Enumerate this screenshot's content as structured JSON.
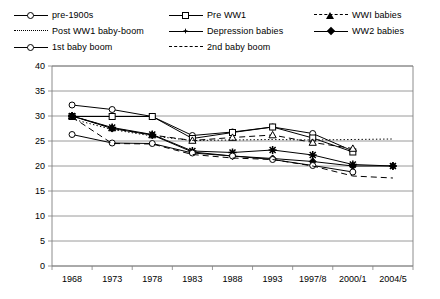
{
  "chart_data": {
    "type": "line",
    "title": "",
    "subtitle": "",
    "xlabel": "",
    "ylabel": "",
    "categories": [
      "1968",
      "1973",
      "1978",
      "1983",
      "1988",
      "1993",
      "1997/8",
      "2000/1",
      "2004/5"
    ],
    "ylim": [
      0,
      40
    ],
    "yticks": [
      0,
      5,
      10,
      15,
      20,
      25,
      30,
      35,
      40
    ],
    "grid": true,
    "legend_position": "top",
    "series": [
      {
        "name": "pre-1900s",
        "marker": "open-circle",
        "line_style": "solid",
        "values": [
          32.2,
          31.3,
          29.9,
          26.1,
          26.8,
          27.8,
          26.5,
          23.0,
          null
        ]
      },
      {
        "name": "Pre WW1",
        "marker": "open-square",
        "line_style": "solid",
        "values": [
          29.9,
          29.9,
          29.9,
          25.5,
          26.7,
          27.8,
          25.6,
          22.8,
          null
        ]
      },
      {
        "name": "WWI babies",
        "marker": "open-triangle",
        "line_style": "dashed",
        "values": [
          30.0,
          27.6,
          26.2,
          25.1,
          25.7,
          26.2,
          24.7,
          23.5,
          null
        ]
      },
      {
        "name": "Post WW1 baby-boom",
        "marker": "none",
        "line_style": "dotted",
        "values": [
          29.4,
          27.3,
          26.0,
          25.1,
          25.2,
          25.3,
          25.2,
          25.3,
          25.4
        ]
      },
      {
        "name": "Depression babies",
        "marker": "star-cross",
        "line_style": "solid",
        "values": [
          30.0,
          27.7,
          26.3,
          23.0,
          22.7,
          23.2,
          22.2,
          20.3,
          20.0
        ]
      },
      {
        "name": "WW2 babies",
        "marker": "filled-diamond",
        "line_style": "solid",
        "values": [
          30.0,
          27.5,
          26.2,
          22.8,
          22.0,
          21.5,
          20.9,
          20.0,
          20.0
        ]
      },
      {
        "name": "1st baby boom",
        "marker": "open-circle",
        "line_style": "solid",
        "values": [
          26.3,
          24.6,
          24.5,
          22.6,
          22.0,
          21.3,
          20.1,
          18.8,
          null
        ]
      },
      {
        "name": "2nd baby boom",
        "marker": "none",
        "line_style": "dashed",
        "values": [
          29.8,
          24.5,
          24.4,
          22.3,
          21.6,
          21.3,
          20.0,
          18.0,
          17.6
        ]
      }
    ]
  },
  "legend": {
    "items": [
      {
        "label": "pre-1900s",
        "key": "solid-open-circle"
      },
      {
        "label": "Pre WW1",
        "key": "solid-open-square"
      },
      {
        "label": "WWI babies",
        "key": "dashed-open-triangle"
      },
      {
        "label": "Post WW1 baby-boom",
        "key": "dotted-none"
      },
      {
        "label": "Depression babies",
        "key": "solid-star-cross"
      },
      {
        "label": "WW2 babies",
        "key": "solid-filled-diamond"
      },
      {
        "label": "1st baby boom",
        "key": "solid-open-circle"
      },
      {
        "label": "2nd baby boom",
        "key": "dashed-none"
      }
    ]
  },
  "axes": {
    "y_ticks": [
      "0",
      "5",
      "10",
      "15",
      "20",
      "25",
      "30",
      "35",
      "40"
    ],
    "x_ticks": [
      "1968",
      "1973",
      "1978",
      "1983",
      "1988",
      "1993",
      "1997/8",
      "2000/1",
      "2004/5"
    ]
  },
  "colors": {
    "line": "#000000",
    "grid": "#808080",
    "frame": "#808080",
    "background": "#ffffff"
  }
}
